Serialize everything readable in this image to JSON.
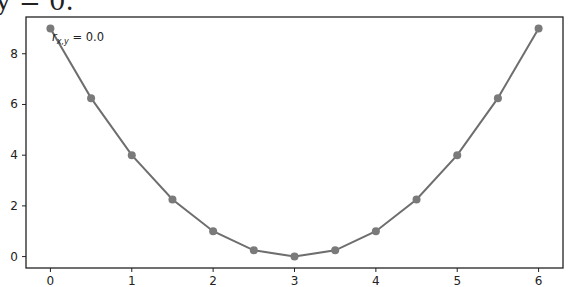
{
  "header_fragment": {
    "text": "y = 0."
  },
  "annotation": {
    "text_main": "r",
    "text_sub": "x,y",
    "text_value": " = 0.0"
  },
  "colors": {
    "line": "#6e6e6e",
    "marker": "#7a7a7a",
    "axes": "#222222",
    "text": "#222222"
  },
  "chart_data": {
    "type": "line",
    "title": "",
    "xlabel": "",
    "ylabel": "",
    "x": [
      0,
      0.5,
      1,
      1.5,
      2,
      2.5,
      3,
      3.5,
      4,
      4.5,
      5,
      5.5,
      6
    ],
    "series": [
      {
        "name": "y = (x-3)^2",
        "values": [
          9,
          6.25,
          4,
          2.25,
          1,
          0.25,
          0,
          0.25,
          1,
          2.25,
          4,
          6.25,
          9
        ]
      }
    ],
    "xticks": [
      0,
      1,
      2,
      3,
      4,
      5,
      6
    ],
    "yticks": [
      0,
      2,
      4,
      6,
      8
    ],
    "xlim": [
      -0.3,
      6.3
    ],
    "ylim": [
      -0.45,
      9.45
    ],
    "grid": false,
    "legend": null,
    "annotations": [
      {
        "text": "r_{x,y} = 0.0",
        "position": "top-left"
      }
    ]
  }
}
